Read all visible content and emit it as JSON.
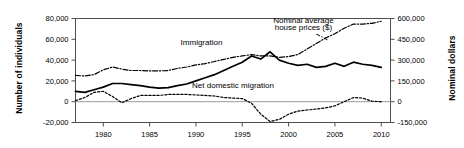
{
  "chart_data": {
    "type": "line",
    "title": "",
    "xlabel": "",
    "ylabel": "Number of individuals",
    "ylabel_right": "Nominal dollars",
    "xlim": [
      1977,
      2011
    ],
    "ylim": [
      -20000,
      80000
    ],
    "ylim_right": [
      -150000,
      600000
    ],
    "grid": false,
    "legend_position": "inline-annotations",
    "xticks": [
      1980,
      1985,
      1990,
      1995,
      2000,
      2005,
      2010
    ],
    "xticklabels": [
      "1980",
      "1985",
      "1990",
      "1995",
      "2000",
      "2005",
      "2010"
    ],
    "yticks": [
      -20000,
      0,
      20000,
      40000,
      60000,
      80000
    ],
    "yticklabels": [
      "-20,000",
      "0",
      "20,000",
      "40,000",
      "60,000",
      "80,000"
    ],
    "yticks_right": [
      -150000,
      0,
      150000,
      300000,
      450000,
      600000
    ],
    "yticklabels_right": [
      "-150,000",
      "0",
      "150,000",
      "300,000",
      "450,000",
      "600,000"
    ],
    "annotations": [
      {
        "text": "Immigration",
        "x": 1990.6,
        "y": 55000
      },
      {
        "text": "Net domestic migration",
        "x": 1994.0,
        "y": 13500
      },
      {
        "text": "Nominal average",
        "x": 2001.6,
        "y": 76000
      },
      {
        "text": "house prices ($)",
        "x": 2001.6,
        "y": 68500
      }
    ],
    "x": [
      1977,
      1978,
      1979,
      1980,
      1981,
      1982,
      1983,
      1984,
      1985,
      1986,
      1987,
      1988,
      1989,
      1990,
      1991,
      1992,
      1993,
      1994,
      1995,
      1996,
      1997,
      1998,
      1999,
      2000,
      2001,
      2002,
      2003,
      2004,
      2005,
      2006,
      2007,
      2008,
      2009,
      2010
    ],
    "series": [
      {
        "name": "Immigration",
        "axis": "left",
        "style": "solid",
        "values": [
          10000,
          9000,
          11500,
          14000,
          17500,
          17500,
          16500,
          15500,
          14000,
          13000,
          13500,
          15500,
          17000,
          20000,
          23000,
          26000,
          30000,
          34000,
          38000,
          44000,
          41000,
          48000,
          40000,
          37000,
          35000,
          36000,
          33000,
          34000,
          37000,
          34000,
          38000,
          36000,
          35000,
          33000
        ]
      },
      {
        "name": "Net domestic migration",
        "axis": "left",
        "style": "dotted",
        "values": [
          1000,
          4000,
          9000,
          10000,
          5000,
          -1000,
          3000,
          6000,
          6000,
          6000,
          7000,
          7000,
          7000,
          6500,
          6000,
          5500,
          4000,
          3500,
          3000,
          -1500,
          -12000,
          -19000,
          -17000,
          -12000,
          -9000,
          -8000,
          -7000,
          -6000,
          -4000,
          0,
          4000,
          3500,
          500,
          0
        ]
      },
      {
        "name": "Nominal average house prices ($)",
        "axis": "right",
        "style": "dashdot",
        "values": [
          190000,
          185000,
          195000,
          230000,
          250000,
          235000,
          225000,
          225000,
          222000,
          222000,
          225000,
          240000,
          250000,
          265000,
          275000,
          290000,
          305000,
          320000,
          330000,
          340000,
          330000,
          330000,
          320000,
          325000,
          340000,
          380000,
          420000,
          460000,
          490000,
          530000,
          560000,
          560000,
          565000,
          580000
        ]
      }
    ]
  },
  "axes": {
    "left_title": "Number of individuals",
    "right_title": "Nominal dollars"
  }
}
